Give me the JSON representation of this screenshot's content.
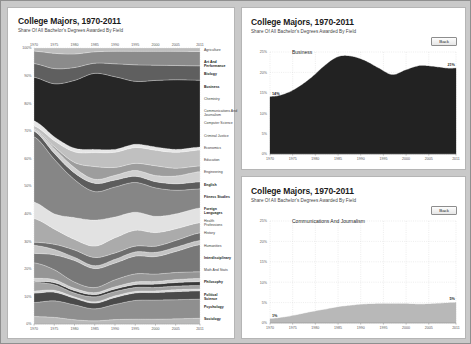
{
  "page": {
    "background_color": "#c9c9c9",
    "panel_color": "#ffffff"
  },
  "panels": {
    "overview": {
      "title": "College Majors, 1970-2011",
      "subtitle": "Share Of All Bachelor's Degrees Awarded By Field"
    },
    "detail_top": {
      "title": "College Majors, 1970-2011",
      "subtitle": "Share Of All Bachelor's Degrees Awarded By Field",
      "series_name": "Business",
      "back_label": "Back",
      "start_value_label": "14%",
      "end_value_label": "21%"
    },
    "detail_bottom": {
      "title": "College Majors, 1970-2011",
      "subtitle": "Share Of All Bachelor's Degrees Awarded By Field",
      "series_name": "Communications And Journalism",
      "back_label": "Back",
      "start_value_label": "1%",
      "end_value_label": "5%"
    }
  },
  "chart_data": [
    {
      "id": "overview",
      "type": "area",
      "stacked": true,
      "title": "College Majors, 1970-2011",
      "subtitle": "Share Of All Bachelor's Degrees Awarded By Field",
      "xlabel": "",
      "ylabel": "",
      "xlim": [
        1970,
        2011
      ],
      "ylim": [
        0,
        100
      ],
      "grid": true,
      "legend_position": "right-labels",
      "x_ticks": [
        1970,
        1975,
        1980,
        1985,
        1990,
        1995,
        2000,
        2005,
        2011
      ],
      "x_tick_labels": [
        "1970",
        "1975",
        "1980",
        "1985",
        "1990",
        "1995",
        "2000",
        "2005",
        "2011"
      ],
      "y_ticks": [
        0,
        10,
        20,
        30,
        40,
        50,
        60,
        70,
        80,
        90,
        100
      ],
      "y_tick_labels": [
        "0%",
        "10%",
        "20%",
        "30%",
        "40%",
        "50%",
        "60%",
        "70%",
        "80%",
        "90%",
        "100%"
      ],
      "x": [
        1970,
        1975,
        1980,
        1985,
        1990,
        1995,
        2000,
        2005,
        2011
      ],
      "series": [
        {
          "name": "Sociology",
          "color": "#b9b9b9",
          "values": [
            2.4,
            2.0,
            1.3,
            1.0,
            1.4,
            1.5,
            1.5,
            1.6,
            1.8
          ]
        },
        {
          "name": "Psychology",
          "color": "#8f8f8f",
          "values": [
            4.5,
            5.0,
            4.5,
            3.8,
            4.8,
            5.8,
            5.9,
            5.9,
            6.0
          ]
        },
        {
          "name": "Political Science",
          "color": "#4a4a4a",
          "values": [
            3.0,
            2.6,
            2.0,
            1.8,
            2.2,
            2.3,
            2.3,
            2.5,
            2.6
          ]
        },
        {
          "name": "Philosophy",
          "color": "#d8d8d8",
          "values": [
            0.7,
            0.6,
            0.4,
            0.4,
            0.5,
            0.5,
            0.5,
            0.6,
            0.6
          ]
        },
        {
          "name": "Math And Stats",
          "color": "#a3a3a3",
          "values": [
            2.8,
            1.7,
            1.2,
            1.6,
            1.4,
            1.2,
            1.1,
            1.1,
            1.1
          ]
        },
        {
          "name": "Interdisciplinary",
          "color": "#3a3a3a",
          "values": [
            0.3,
            0.6,
            0.7,
            0.7,
            0.8,
            0.9,
            1.0,
            1.1,
            1.2
          ]
        },
        {
          "name": "Humanities",
          "color": "#cfcfcf",
          "values": [
            1.0,
            0.9,
            0.7,
            0.6,
            0.7,
            0.8,
            0.8,
            0.9,
            1.0
          ]
        },
        {
          "name": "History",
          "color": "#959595",
          "values": [
            5.0,
            3.0,
            1.9,
            1.6,
            2.2,
            2.5,
            2.3,
            2.2,
            2.1
          ]
        },
        {
          "name": "Health Professions",
          "color": "#787878",
          "values": [
            3.0,
            4.5,
            6.5,
            6.0,
            5.3,
            5.5,
            5.4,
            6.5,
            8.5
          ]
        },
        {
          "name": "Foreign Languages",
          "color": "#c4c4c4",
          "values": [
            2.6,
            1.6,
            1.0,
            0.9,
            1.2,
            1.3,
            1.3,
            1.3,
            1.3
          ]
        },
        {
          "name": "Fitness Studies",
          "color": "#6d6d6d",
          "values": [
            1.0,
            1.6,
            2.2,
            2.6,
            2.0,
            1.8,
            1.9,
            2.1,
            2.4
          ]
        },
        {
          "name": "English",
          "color": "#ababab",
          "values": [
            7.6,
            4.6,
            3.2,
            3.6,
            4.8,
            4.9,
            4.2,
            3.6,
            3.2
          ]
        },
        {
          "name": "Engineering",
          "color": "#e2e2e2",
          "values": [
            5.3,
            4.6,
            6.6,
            8.2,
            6.6,
            5.6,
            5.0,
            4.6,
            4.6
          ]
        },
        {
          "name": "Education",
          "color": "#868686",
          "values": [
            21.0,
            16.5,
            11.5,
            9.0,
            9.5,
            9.2,
            8.8,
            7.3,
            6.0
          ]
        },
        {
          "name": "Economics",
          "color": "#5c5c5c",
          "values": [
            1.8,
            1.8,
            2.0,
            2.6,
            2.2,
            1.9,
            1.9,
            2.0,
            2.2
          ]
        },
        {
          "name": "Criminal Justice",
          "color": "#d0d0d0",
          "values": [
            0.4,
            1.4,
            1.6,
            1.3,
            1.5,
            1.8,
            1.9,
            2.4,
            3.2
          ]
        },
        {
          "name": "Computer Science",
          "color": "#9d9d9d",
          "values": [
            0.3,
            0.6,
            1.6,
            4.0,
            2.5,
            2.2,
            3.0,
            2.4,
            1.8
          ]
        },
        {
          "name": "Communications And Journalism",
          "color": "#c0c0c0",
          "values": [
            1.0,
            1.8,
            3.2,
            4.4,
            4.8,
            4.9,
            4.8,
            4.9,
            5.0
          ]
        },
        {
          "name": "Chemistry",
          "color": "#e6e6e6",
          "values": [
            1.6,
            1.2,
            1.1,
            1.0,
            0.9,
            1.0,
            1.0,
            0.9,
            0.9
          ]
        },
        {
          "name": "Business",
          "color": "#262626",
          "values": [
            14.0,
            16.0,
            20.5,
            24.0,
            23.0,
            19.5,
            20.5,
            21.5,
            21.0
          ]
        },
        {
          "name": "Biology",
          "color": "#5f5f5f",
          "values": [
            4.4,
            4.6,
            3.9,
            3.2,
            4.1,
            5.1,
            4.7,
            4.4,
            4.5
          ]
        },
        {
          "name": "Art And Performance",
          "color": "#8b8b8b",
          "values": [
            4.0,
            4.6,
            4.1,
            3.6,
            4.0,
            4.2,
            4.3,
            4.4,
            4.5
          ]
        },
        {
          "name": "Agriculture",
          "color": "#bdbdbd",
          "values": [
            1.0,
            1.6,
            1.8,
            1.2,
            1.0,
            1.0,
            1.0,
            1.0,
            1.1
          ]
        }
      ],
      "category_labels": [
        "Agriculture",
        "Art And Performance",
        "Biology",
        "Business",
        "Chemistry",
        "Communications And Journalism",
        "Computer Science",
        "Criminal Justice",
        "Economics",
        "Education",
        "Engineering",
        "English",
        "Fitness Studies",
        "Foreign Languages",
        "Health Professions",
        "History",
        "Humanities",
        "Interdisciplinary",
        "Math And Stats",
        "Philosophy",
        "Political Science",
        "Psychology",
        "Sociology"
      ]
    },
    {
      "id": "detail_top",
      "type": "area",
      "stacked": false,
      "title": "College Majors, 1970-2011",
      "subtitle": "Share Of All Bachelor's Degrees Awarded By Field",
      "series_name": "Business",
      "color": "#222222",
      "xlabel": "",
      "ylabel": "",
      "xlim": [
        1970,
        2011
      ],
      "ylim": [
        0,
        25
      ],
      "grid": true,
      "x_ticks": [
        1970,
        1975,
        1980,
        1985,
        1990,
        1995,
        2000,
        2005,
        2011
      ],
      "x_tick_labels": [
        "1970",
        "1975",
        "1980",
        "1985",
        "1990",
        "1995",
        "2000",
        "2005",
        "2011"
      ],
      "y_ticks": [
        0,
        5,
        10,
        15,
        20,
        25
      ],
      "y_tick_labels": [
        "0%",
        "5%",
        "10%",
        "15%",
        "20%",
        "25%"
      ],
      "x": [
        1970,
        1973,
        1976,
        1979,
        1982,
        1985,
        1988,
        1991,
        1994,
        1997,
        2000,
        2003,
        2006,
        2009,
        2011
      ],
      "values": [
        14.0,
        14.6,
        16.2,
        18.6,
        21.6,
        23.8,
        23.9,
        22.8,
        21.0,
        19.4,
        20.6,
        21.6,
        21.4,
        21.0,
        21.0
      ],
      "start_label": "14%",
      "end_label": "21%"
    },
    {
      "id": "detail_bottom",
      "type": "area",
      "stacked": false,
      "title": "College Majors, 1970-2011",
      "subtitle": "Share Of All Bachelor's Degrees Awarded By Field",
      "series_name": "Communications And Journalism",
      "color": "#b8b8b8",
      "xlabel": "",
      "ylabel": "",
      "xlim": [
        1970,
        2011
      ],
      "ylim": [
        0,
        25
      ],
      "grid": true,
      "x_ticks": [
        1970,
        1975,
        1980,
        1985,
        1990,
        1995,
        2000,
        2005,
        2011
      ],
      "x_tick_labels": [
        "1970",
        "1975",
        "1980",
        "1985",
        "1990",
        "1995",
        "2000",
        "2005",
        "2011"
      ],
      "y_ticks": [
        0,
        5,
        10,
        15,
        20,
        25
      ],
      "y_tick_labels": [
        "0%",
        "5%",
        "10%",
        "15%",
        "20%",
        "25%"
      ],
      "x": [
        1970,
        1973,
        1976,
        1979,
        1982,
        1985,
        1988,
        1991,
        1994,
        1997,
        2000,
        2003,
        2006,
        2009,
        2011
      ],
      "values": [
        1.0,
        1.4,
        2.0,
        2.7,
        3.3,
        3.9,
        4.3,
        4.6,
        4.7,
        4.7,
        4.7,
        4.6,
        4.7,
        4.9,
        5.0
      ],
      "start_label": "1%",
      "end_label": "5%"
    }
  ]
}
